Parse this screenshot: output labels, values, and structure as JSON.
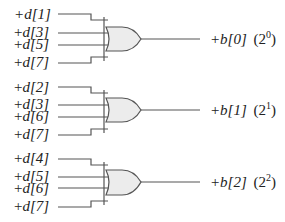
{
  "diagram": {
    "type": "logic-circuit",
    "gates": [
      {
        "type": "OR",
        "inputs": [
          "+d[1]",
          "+d[3]",
          "+d[5]",
          "+d[7]"
        ],
        "output": {
          "signal": "+b[0]",
          "weight_base": "(2",
          "weight_exp": "0",
          "weight_close": ")"
        }
      },
      {
        "type": "OR",
        "inputs": [
          "+d[2]",
          "+d[3]",
          "+d[6]",
          "+d[7]"
        ],
        "output": {
          "signal": "+b[1]",
          "weight_base": "(2",
          "weight_exp": "1",
          "weight_close": ")"
        }
      },
      {
        "type": "OR",
        "inputs": [
          "+d[4]",
          "+d[5]",
          "+d[6]",
          "+d[7]"
        ],
        "output": {
          "signal": "+b[2]",
          "weight_base": "(2",
          "weight_exp": "2",
          "weight_close": ")"
        }
      }
    ]
  },
  "colors": {
    "wire": "#555555",
    "gate_fill": "#ececec",
    "text": "#222222"
  }
}
